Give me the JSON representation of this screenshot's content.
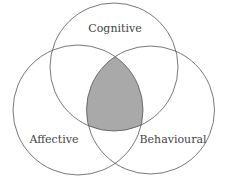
{
  "diagram": {
    "type": "venn",
    "sets": [
      {
        "id": "cognitive",
        "label": "Cognitive"
      },
      {
        "id": "affective",
        "label": "Affective"
      },
      {
        "id": "behavioural",
        "label": "Behavioural"
      }
    ],
    "highlighted_region": "intersection of all three",
    "colors": {
      "stroke": "#555555",
      "highlight_fill": "#a9a9a9",
      "background": "#ffffff"
    }
  }
}
